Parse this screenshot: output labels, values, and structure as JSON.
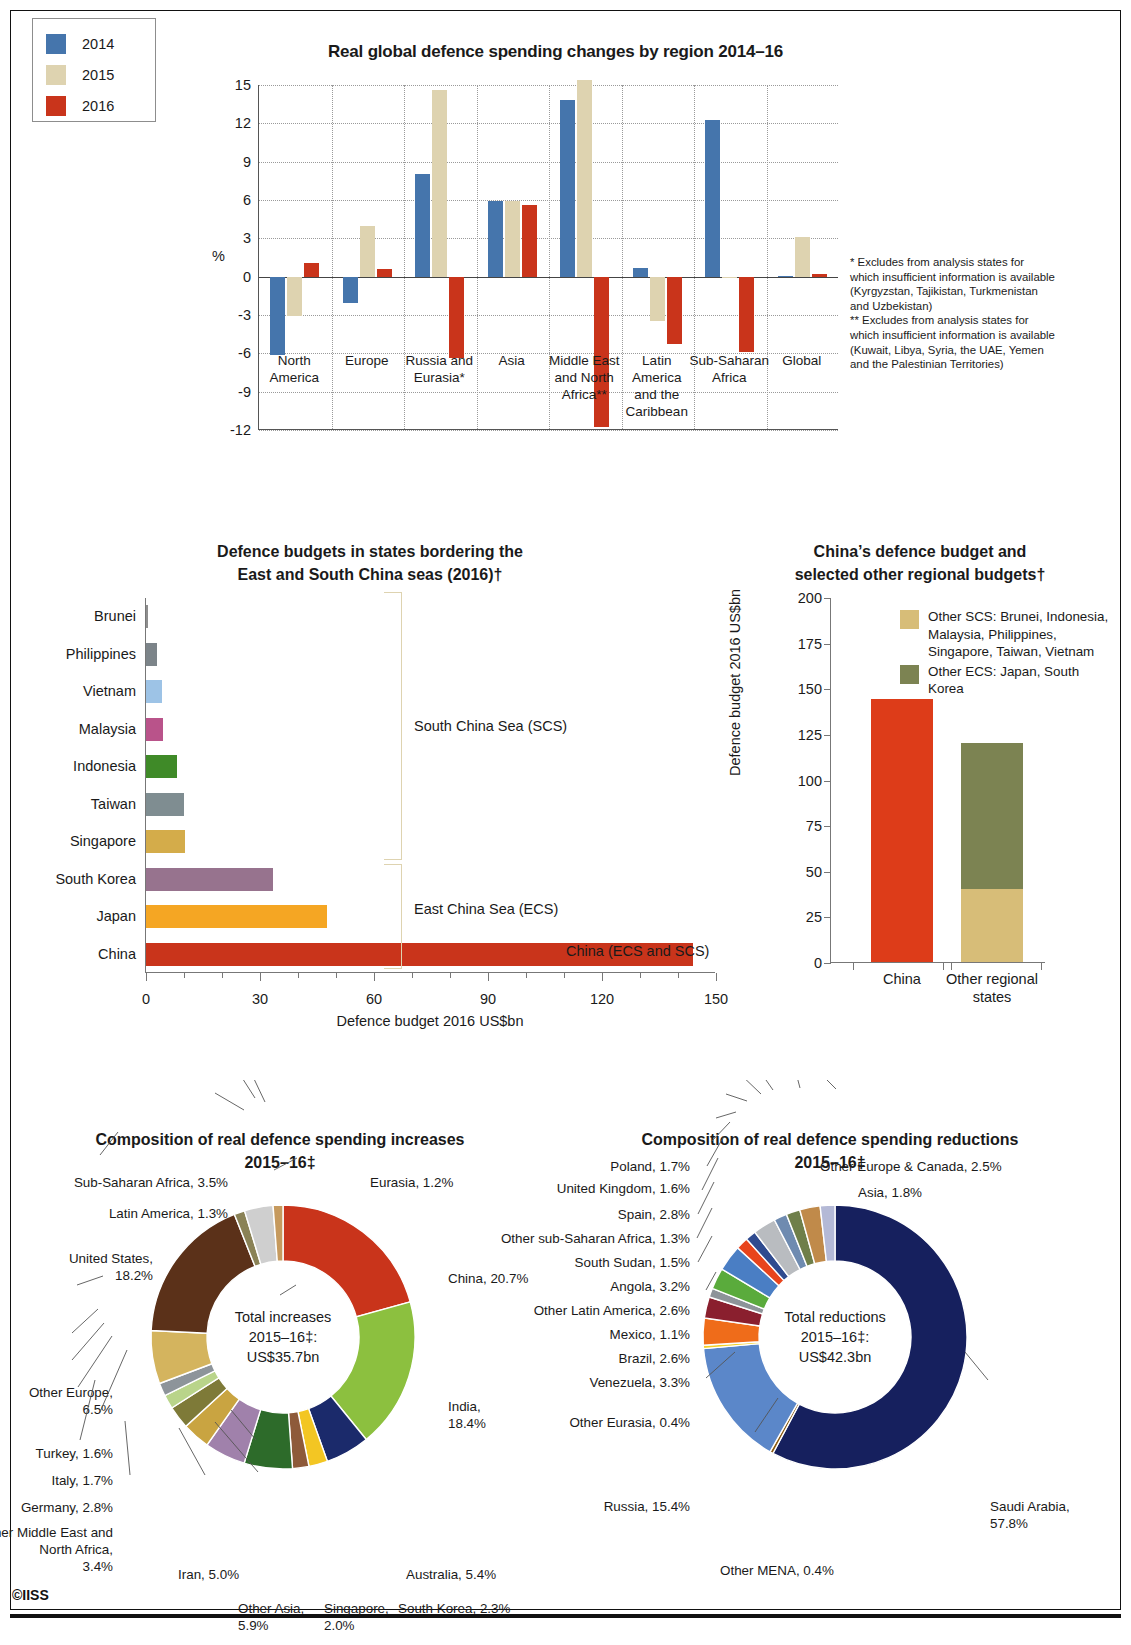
{
  "copyright": "©IISS",
  "chart_data": [
    {
      "type": "bar",
      "title": "Real global defence spending changes by region 2014–16",
      "ylabel": "%",
      "ylim": [
        -12,
        15
      ],
      "yticks": [
        15,
        12,
        9,
        6,
        3,
        0,
        -3,
        -6,
        -9,
        -12
      ],
      "grid": true,
      "legend_position": "top-left",
      "categories": [
        "North\nAmerica",
        "Europe",
        "Russia and\nEurasia*",
        "Asia",
        "Middle East\nand North\nAfrica**",
        "Latin\nAmerica\nand the\nCaribbean",
        "Sub-Saharan\nAfrica",
        "Global"
      ],
      "series": [
        {
          "name": "2014",
          "color": "#4575ac",
          "values": [
            -6.1,
            -2.1,
            8.0,
            5.9,
            13.8,
            0.7,
            12.3,
            0.05
          ]
        },
        {
          "name": "2015",
          "color": "#ded3b0",
          "values": [
            -3.1,
            4.0,
            14.6,
            5.9,
            15.4,
            -3.5,
            -0.1,
            3.1
          ]
        },
        {
          "name": "2016",
          "color": "#c9341b",
          "values": [
            1.1,
            0.6,
            -6.4,
            5.6,
            -11.8,
            -5.3,
            -5.9,
            0.2
          ]
        }
      ],
      "notes": [
        "* Excludes from analysis states for which insufficient information is available (Kyrgyzstan, Tajikistan, Turkmenistan and Uzbekistan)",
        "** Excludes from analysis states for which insufficient information is available (Kuwait, Libya, Syria, the UAE, Yemen and the Palestinian Territories)"
      ]
    },
    {
      "type": "bar",
      "orientation": "horizontal",
      "title": "Defence budgets in states bordering the East and South China seas (2016)†",
      "xlabel": "Defence budget 2016 US$bn",
      "xlim": [
        0,
        150
      ],
      "xticks": [
        0,
        30,
        60,
        90,
        120,
        150
      ],
      "categories": [
        "Brunei",
        "Philippines",
        "Vietnam",
        "Malaysia",
        "Indonesia",
        "Taiwan",
        "Singapore",
        "South Korea",
        "Japan",
        "China"
      ],
      "values": [
        0.35,
        3.0,
        4.2,
        4.6,
        8.2,
        10.1,
        10.2,
        33.5,
        47.5,
        144.0
      ],
      "colors": [
        "#8e8e8e",
        "#7c8489",
        "#9dc3e6",
        "#b9538a",
        "#3f8a28",
        "#7f8d91",
        "#d4ac4a",
        "#97738e",
        "#f5a623",
        "#c9341b"
      ],
      "annotations": [
        {
          "label": "South China Sea (SCS)"
        },
        {
          "label": "East China Sea (ECS)"
        },
        {
          "label": "China (ECS and SCS)"
        }
      ]
    },
    {
      "type": "bar",
      "stacked": true,
      "title": "China’s defence budget and selected other regional budgets†",
      "ylabel": "Defence budget 2016 US$bn",
      "ylim": [
        0,
        200
      ],
      "yticks": [
        200,
        175,
        150,
        125,
        100,
        75,
        50,
        25,
        0
      ],
      "categories": [
        "China",
        "Other regional\nstates"
      ],
      "series": [
        {
          "name": "China",
          "color": "#dd3c19",
          "values": [
            144,
            0
          ]
        },
        {
          "name": "Other SCS: Brunei, Indonesia, Malaysia, Philippines, Singapore, Taiwan, Vietnam",
          "color": "#d7bd78",
          "values": [
            0,
            40
          ]
        },
        {
          "name": "Other ECS: Japan, South Korea",
          "color": "#7c8352",
          "values": [
            0,
            80
          ]
        }
      ]
    },
    {
      "type": "pie",
      "title": "Composition of real defence spending increases 2015–16‡",
      "center_text": "Total increases\n2015–16‡:\nUS$35.7bn",
      "labels": [
        "China, 20.7%",
        "India, 18.4%",
        "Australia, 5.4%",
        "South Korea, 2.3%",
        "Singapore, 2.0%",
        "Other Asia, 5.9%",
        "Iran, 5.0%",
        "Other Middle East and North Africa, 3.4%",
        "Germany, 2.8%",
        "Italy, 1.7%",
        "Turkey, 1.6%",
        "Other Europe, 6.5%",
        "United States, 18.2%",
        "Latin America, 1.3%",
        "Sub-Saharan Africa, 3.5%",
        "Eurasia, 1.2%"
      ],
      "values": [
        20.7,
        18.4,
        5.4,
        2.3,
        2.0,
        5.9,
        5.0,
        3.4,
        2.8,
        1.7,
        1.6,
        6.5,
        18.2,
        1.3,
        3.5,
        1.2
      ],
      "colors": [
        "#c9341b",
        "#8cc03f",
        "#1b2a6b",
        "#f3c623",
        "#8e5a3a",
        "#2d6b2a",
        "#a081ab",
        "#c9a441",
        "#7e7a38",
        "#b9d48a",
        "#8d949a",
        "#d4b45e",
        "#5b3119",
        "#8a8256",
        "#cfcfcf",
        "#c69a5e"
      ]
    },
    {
      "type": "pie",
      "title": "Composition of real defence spending reductions 2015–16‡",
      "center_text": "Total reductions\n2015–16‡:\nUS$42.3bn",
      "labels": [
        "Saudi Arabia, 57.8%",
        "Other MENA, 0.4%",
        "Russia, 15.4%",
        "Other Eurasia, 0.4%",
        "Venezuela, 3.3%",
        "Brazil, 2.6%",
        "Mexico, 1.1%",
        "Other Latin America, 2.6%",
        "Angola, 3.2%",
        "South Sudan, 1.5%",
        "Other sub-Saharan Africa, 1.3%",
        "Spain, 2.8%",
        "United Kingdom, 1.6%",
        "Poland, 1.7%",
        "Other Europe & Canada, 2.5%",
        "Asia, 1.8%"
      ],
      "values": [
        57.8,
        0.4,
        15.4,
        0.4,
        3.3,
        2.6,
        1.1,
        2.6,
        3.2,
        1.5,
        1.3,
        2.8,
        1.6,
        1.7,
        2.5,
        1.8
      ],
      "colors": [
        "#16205e",
        "#8a5a10",
        "#5b87c9",
        "#f2d027",
        "#ef6c1a",
        "#8a1f2e",
        "#8d9499",
        "#5aab3c",
        "#4a7ec4",
        "#e8441c",
        "#2f4b8f",
        "#b9bcc0",
        "#6f8bb0",
        "#6f7f4a",
        "#c08a4a",
        "#b4b9d6"
      ]
    }
  ],
  "sec1": {
    "title": "Real global defence spending changes by region 2014–16",
    "ylabel": "%",
    "yticks": [
      "15",
      "12",
      "9",
      "6",
      "3",
      "0",
      "-3",
      "-6",
      "-9",
      "-12"
    ],
    "legend": [
      "2014",
      "2015",
      "2016"
    ],
    "cats": [
      "North\nAmerica",
      "Europe",
      "Russia and\nEurasia*",
      "Asia",
      "Middle East\nand North\nAfrica**",
      "Latin\nAmerica\nand the\nCaribbean",
      "Sub-Saharan\nAfrica",
      "Global"
    ],
    "note1": "* Excludes from analysis states for which insufficient information is available (Kyrgyzstan, Tajikistan, Turkmenistan and Uzbekistan)",
    "note2": "** Excludes from analysis states for which insufficient information is available (Kuwait, Libya, Syria, the UAE, Yemen and the Palestinian Territories)"
  },
  "sec2": {
    "title_left_1": "Defence budgets in states bordering the",
    "title_left_2": "East and South China seas (2016)†",
    "xlabel": "Defence budget 2016 US$bn",
    "xticks": [
      "0",
      "30",
      "60",
      "90",
      "120",
      "150"
    ],
    "cats": [
      "Brunei",
      "Philippines",
      "Vietnam",
      "Malaysia",
      "Indonesia",
      "Taiwan",
      "Singapore",
      "South Korea",
      "Japan",
      "China"
    ],
    "ann_scs": "South China Sea (SCS)",
    "ann_ecs": "East China Sea (ECS)",
    "ann_china": "China (ECS and SCS)",
    "title_right_1": "China’s defence budget and",
    "title_right_2": "selected other regional budgets†",
    "ylabel_right": "Defence budget 2016 US$bn",
    "yticks_right": [
      "200",
      "175",
      "150",
      "125",
      "100",
      "75",
      "50",
      "25",
      "0"
    ],
    "legend_scs": "Other SCS: Brunei, Indonesia, Malaysia, Philippines, Singapore, Taiwan, Vietnam",
    "legend_ecs": "Other ECS: Japan, South Korea",
    "cat_china": "China",
    "cat_other": "Other regional\nstates"
  },
  "sec3": {
    "title_left_1": "Composition of real defence spending increases",
    "title_left_2": "2015–16‡",
    "center_left_1": "Total increases",
    "center_left_2": "2015–16‡:",
    "center_left_3": "US$35.7bn",
    "title_right_1": "Composition of real defence spending reductions",
    "title_right_2": "2015–16‡",
    "center_right_1": "Total reductions",
    "center_right_2": "2015–16‡:",
    "center_right_3": "US$42.3bn"
  }
}
